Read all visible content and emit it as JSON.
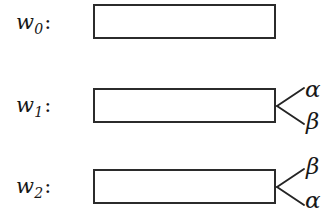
{
  "figure": {
    "background_color": "#ffffff",
    "ink_color": "#1f1f1f",
    "rows": [
      {
        "label_word": "w",
        "label_subscript": "0",
        "label_colon": ":",
        "label_full": "w0:",
        "box": {
          "x": 93,
          "y": 4,
          "width": 183,
          "height": 35
        },
        "branches": []
      },
      {
        "label_word": "w",
        "label_subscript": "1",
        "label_colon": ":",
        "label_full": "w1:",
        "box": {
          "x": 93,
          "y": 88,
          "width": 183,
          "height": 35
        },
        "branches": [
          {
            "position": "upper",
            "label": "α"
          },
          {
            "position": "lower",
            "label": "β"
          }
        ]
      },
      {
        "label_word": "w",
        "label_subscript": "2",
        "label_colon": ":",
        "label_full": "w2:",
        "box": {
          "x": 93,
          "y": 169,
          "width": 183,
          "height": 35
        },
        "branches": [
          {
            "position": "upper",
            "label": "β"
          },
          {
            "position": "lower",
            "label": "α"
          }
        ]
      }
    ]
  }
}
